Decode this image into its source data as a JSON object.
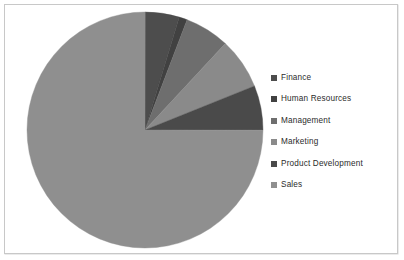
{
  "chart_data": {
    "type": "pie",
    "title": "",
    "legend_position": "right",
    "categories": [
      "Finance",
      "Human Resources",
      "Management",
      "Marketing",
      "Product Development",
      "Sales"
    ],
    "values": [
      4.7,
      1.1,
      6.1,
      7.0,
      6.1,
      75.0
    ],
    "units": "percent",
    "start_angle_deg": 0,
    "direction": "clockwise",
    "slice_angles_deg": [
      16.9,
      4.0,
      22.0,
      25.2,
      22.0,
      270.0
    ],
    "colors": [
      "#4d4d4d",
      "#414141",
      "#6e6e6e",
      "#8a8a8a",
      "#4a4a4a",
      "#8f8f8f"
    ]
  },
  "legend": {
    "items": [
      {
        "label": "Finance",
        "color": "#4d4d4d"
      },
      {
        "label": "Human Resources",
        "color": "#414141"
      },
      {
        "label": "Management",
        "color": "#6e6e6e"
      },
      {
        "label": "Marketing",
        "color": "#8a8a8a"
      },
      {
        "label": "Product Development",
        "color": "#4a4a4a"
      },
      {
        "label": "Sales",
        "color": "#8f8f8f"
      }
    ]
  },
  "frame": {
    "border_color": "#c8c8c8",
    "background": "#ffffff"
  }
}
